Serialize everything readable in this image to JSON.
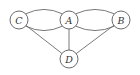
{
  "diagram": {
    "type": "multigraph",
    "nodes": [
      {
        "id": "C",
        "label": "C"
      },
      {
        "id": "A",
        "label": "A"
      },
      {
        "id": "B",
        "label": "B"
      },
      {
        "id": "D",
        "label": "D"
      }
    ],
    "edges": [
      {
        "from": "C",
        "to": "A",
        "shape": "arc-up"
      },
      {
        "from": "C",
        "to": "A",
        "shape": "arc-down"
      },
      {
        "from": "A",
        "to": "B",
        "shape": "arc-up"
      },
      {
        "from": "A",
        "to": "B",
        "shape": "arc-down"
      },
      {
        "from": "C",
        "to": "D",
        "shape": "straight"
      },
      {
        "from": "A",
        "to": "D",
        "shape": "straight"
      },
      {
        "from": "B",
        "to": "D",
        "shape": "straight"
      }
    ],
    "colors": {
      "stroke": "#5a5a5a",
      "label": "#333333",
      "background": "#ffffff"
    }
  }
}
